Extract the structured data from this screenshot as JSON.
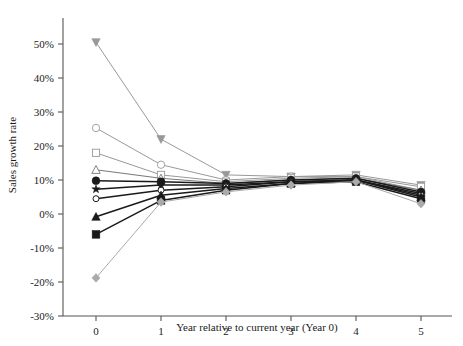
{
  "chart_data": {
    "type": "line",
    "title": "",
    "xlabel": "Year relative to current year (Year 0)",
    "ylabel": "Sales growth rate",
    "x": [
      0,
      1,
      2,
      3,
      4,
      5
    ],
    "xticklabels": [
      "0",
      "1",
      "2",
      "3",
      "4",
      "5"
    ],
    "yticklabels": [
      "-30%",
      "-20%",
      "-10%",
      "0%",
      "10%",
      "20%",
      "30%",
      "40%",
      "50%"
    ],
    "yticks": [
      -30,
      -20,
      -10,
      0,
      10,
      20,
      30,
      40,
      50
    ],
    "xlim": [
      -0.5,
      5.5
    ],
    "ylim": [
      -30,
      55
    ],
    "grid": false,
    "legend": false,
    "y_unit": "percent",
    "series": [
      {
        "name": "series-1",
        "marker": "triangle-down-filled",
        "color": "#999999",
        "values": [
          50.5,
          22.0,
          11.5,
          11.0,
          11.5,
          8.5
        ]
      },
      {
        "name": "series-2",
        "marker": "circle-open",
        "color": "#999999",
        "values": [
          25.3,
          14.5,
          10.0,
          11.0,
          11.0,
          7.0
        ]
      },
      {
        "name": "series-3",
        "marker": "square-open",
        "color": "#999999",
        "values": [
          18.0,
          11.5,
          9.5,
          10.5,
          11.0,
          8.0
        ]
      },
      {
        "name": "series-4",
        "marker": "triangle-up-open",
        "color": "#777777",
        "values": [
          13.0,
          10.5,
          9.0,
          10.0,
          10.5,
          7.0
        ]
      },
      {
        "name": "series-5",
        "marker": "circle-filled",
        "color": "#1a1a1a",
        "values": [
          9.8,
          9.5,
          9.0,
          10.0,
          10.5,
          6.5
        ]
      },
      {
        "name": "series-6",
        "marker": "star-filled",
        "color": "#1a1a1a",
        "values": [
          7.3,
          8.5,
          8.5,
          9.5,
          10.0,
          6.0
        ]
      },
      {
        "name": "series-7",
        "marker": "circle-small-open",
        "color": "#1a1a1a",
        "values": [
          4.5,
          7.0,
          8.0,
          9.5,
          10.0,
          5.5
        ]
      },
      {
        "name": "series-8",
        "marker": "triangle-up-filled",
        "color": "#1a1a1a",
        "values": [
          -0.8,
          5.5,
          7.5,
          9.0,
          10.0,
          5.0
        ]
      },
      {
        "name": "series-9",
        "marker": "square-filled",
        "color": "#1a1a1a",
        "values": [
          -6.0,
          4.0,
          7.0,
          9.0,
          9.5,
          4.5
        ]
      },
      {
        "name": "series-10",
        "marker": "diamond-filled",
        "color": "#aaaaaa",
        "values": [
          -18.8,
          3.5,
          6.5,
          8.5,
          9.5,
          3.0
        ]
      }
    ]
  }
}
